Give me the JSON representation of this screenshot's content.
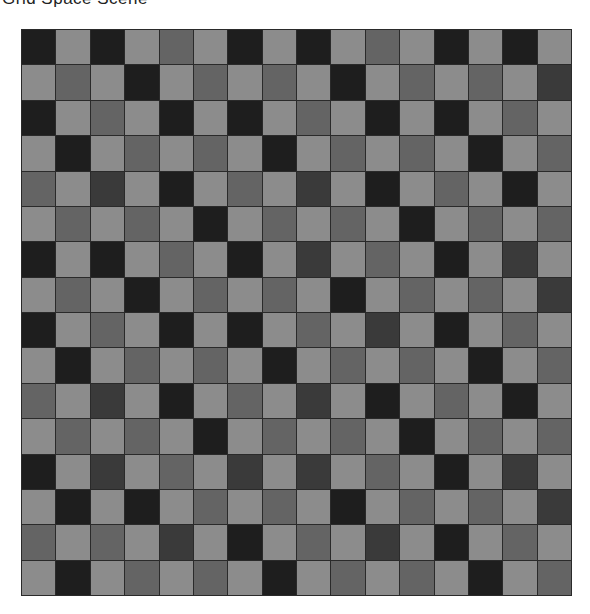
{
  "header": {
    "title": "Grid Space Scene"
  },
  "grid": {
    "rows": 16,
    "cols": 16,
    "palette": {
      "D": "#1e1e1e",
      "K": "#3a3a3a",
      "M": "#646464",
      "L": "#8c8c8c"
    },
    "cells": [
      "DLDLMLDLDLMLDLDL",
      "LMLDLMLMLDLMLMLK",
      "DLMLDLDLMLDLDLML",
      "LDLMLMLDLMLMLDLM",
      "MLKLDLMLKLDLMLDL",
      "LMLMLDLMLMLDLMLM",
      "DLDLMLDLKLMLDLKL",
      "LMLDLMLMLDLMLMLK",
      "DLMLDLDLMLKLDLML",
      "LDLMLMLDLMLMLDLM",
      "MLKLDLMLKLDLMLDL",
      "LMLMLDLMLMLDLMLM",
      "DLKLMLKLKLMLDLKL",
      "LDLDLMLMLDLMLMLK",
      "MLMLKLDLMLKLDLML",
      "LDLMLMLDLMLMLDLM"
    ]
  }
}
